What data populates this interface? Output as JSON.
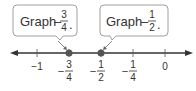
{
  "diagram": {
    "type": "number-line",
    "range": [
      -1.2,
      0.2
    ],
    "colors": {
      "line": "#333333",
      "point": "#555555",
      "callout_border": "#999999",
      "callout_fill": "#ffffff",
      "text": "#333333"
    },
    "callouts": [
      {
        "prefix": "Graph",
        "sign": "–",
        "numerator": "3",
        "denominator": "4",
        "suffix": ".",
        "target_value": -0.75
      },
      {
        "prefix": "Graph",
        "sign": "–",
        "numerator": "1",
        "denominator": "2",
        "suffix": ".",
        "target_value": -0.5
      }
    ],
    "ticks": [
      {
        "value": -1,
        "label": "−1",
        "is_fraction": false
      },
      {
        "value": -0.75,
        "sign": "–",
        "numerator": "3",
        "denominator": "4",
        "is_fraction": true
      },
      {
        "value": -0.5,
        "sign": "–",
        "numerator": "1",
        "denominator": "2",
        "is_fraction": true
      },
      {
        "value": -0.25,
        "sign": "–",
        "numerator": "1",
        "denominator": "4",
        "is_fraction": true
      },
      {
        "value": 0,
        "label": "0",
        "is_fraction": false
      }
    ],
    "points": [
      {
        "value": -0.75,
        "label": "-3/4"
      },
      {
        "value": -0.5,
        "label": "-1/2"
      }
    ]
  }
}
